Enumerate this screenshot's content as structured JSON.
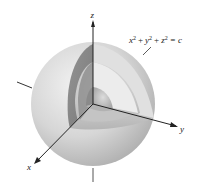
{
  "figure": {
    "equation_label": "x² + y² + z² = c",
    "equation_parts": {
      "x": "x",
      "y": "y",
      "z": "z",
      "exp": "2",
      "plus": "+",
      "eq": "= c"
    },
    "axes": {
      "x_label": "x",
      "y_label": "y",
      "z_label": "z"
    },
    "shell_count": 3,
    "colors": {
      "outer_shell": "#c9c9c9",
      "middle_shell": "#b0b0b0",
      "inner_shell": "#9a9a9a",
      "cut_face_dark": "#7d7d7d",
      "axis": "#222222"
    }
  }
}
